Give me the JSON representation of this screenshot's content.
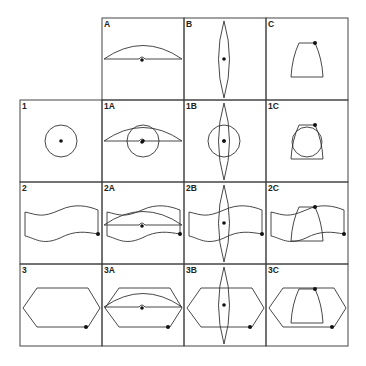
{
  "figure": {
    "columns": [
      "A",
      "B",
      "C"
    ],
    "rows": [
      "1",
      "2",
      "3"
    ],
    "cells": {
      "A": "A",
      "B": "B",
      "C": "C",
      "1": "1",
      "1A": "1A",
      "1B": "1B",
      "1C": "1C",
      "2": "2",
      "2A": "2A",
      "2B": "2B",
      "2C": "2C",
      "3": "3",
      "3A": "3A",
      "3B": "3B",
      "3C": "3C"
    },
    "shapes": {
      "A": "dome-arc-with-center-dot",
      "B": "vertical-lens-with-center-dot",
      "C": "trapezoid-with-corner-dot",
      "1": "circle-with-center-dot",
      "2": "wavy-band-with-corner-dot",
      "3": "hexagon-with-corner-dot"
    },
    "colors": {
      "line": "#333333",
      "grid": "#444444",
      "background": "#ffffff"
    }
  }
}
